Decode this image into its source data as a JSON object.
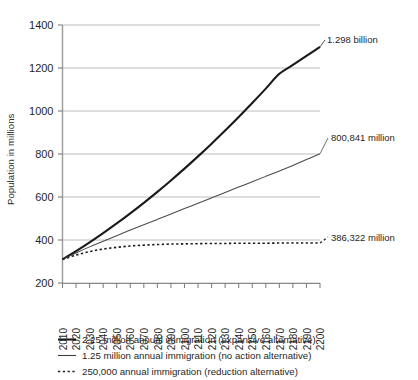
{
  "chart_data": {
    "type": "line",
    "title": "",
    "xlabel": "",
    "ylabel": "Population in millions",
    "xlim": [
      2010,
      2200
    ],
    "ylim": [
      200,
      1400
    ],
    "yticks": [
      200,
      400,
      600,
      800,
      1000,
      1200,
      1400
    ],
    "grid": "horizontal",
    "legend_position": "below",
    "x": [
      2010,
      2020,
      2030,
      2040,
      2050,
      2060,
      2070,
      2080,
      2090,
      2100,
      2110,
      2120,
      2130,
      2140,
      2150,
      2160,
      2170,
      2180,
      2190,
      2200
    ],
    "series": [
      {
        "name": "2.25 million annual immigration (expansive alternative)",
        "style": "solid-thick",
        "color": "#1a1a1a",
        "end_label": "1.298 billion",
        "end_value": 1298,
        "values": [
          310,
          348,
          389,
          432,
          477,
          524,
          573,
          624,
          677,
          732,
          789,
          848,
          909,
          972,
          1037,
          1104,
          1173,
          1214,
          1256,
          1298
        ]
      },
      {
        "name": "1.25 million annual immigration (no action alternative)",
        "style": "solid-thin",
        "color": "#4a4a4a",
        "end_label": "800,841 million",
        "end_value": 801,
        "values": [
          310,
          340,
          368,
          394,
          420,
          446,
          471,
          496,
          521,
          546,
          571,
          596,
          621,
          646,
          671,
          696,
          721,
          747,
          774,
          801
        ]
      },
      {
        "name": "250,000 annual immigration (reduction alternative)",
        "style": "dotted",
        "color": "#1a1a1a",
        "end_label": "386,322 million",
        "end_value": 386,
        "values": [
          310,
          330,
          346,
          358,
          366,
          372,
          376,
          379,
          381,
          382,
          383,
          384,
          384,
          385,
          385,
          385,
          386,
          386,
          386,
          386
        ]
      }
    ],
    "xtick_labels": [
      "2010",
      "2020",
      "2030",
      "2040",
      "2050",
      "2060",
      "2070",
      "2080",
      "2090",
      "2100",
      "2110",
      "2120",
      "2130",
      "2140",
      "2150",
      "2160",
      "2170",
      "2180",
      "2190",
      "2200"
    ],
    "ytick_labels": [
      "200",
      "400",
      "600",
      "800",
      "1000",
      "1200",
      "1400"
    ],
    "annotations": [
      {
        "text": "1.298 billion",
        "series": 0
      },
      {
        "text": "800,841 million",
        "series": 1
      },
      {
        "text": "386,322 million",
        "series": 2
      }
    ]
  },
  "axis": {
    "y_title": "Population in millions"
  },
  "legend": {
    "items": [
      {
        "label": "2.25 million annual immigration (expansive alternative)",
        "marker": "solid-thick-line-swatch"
      },
      {
        "label": "1.25 million annual immigration (no action alternative)",
        "marker": "solid-thin-line-swatch"
      },
      {
        "label": "250,000 annual immigration (reduction alternative)",
        "marker": "dotted-line-swatch"
      }
    ]
  }
}
